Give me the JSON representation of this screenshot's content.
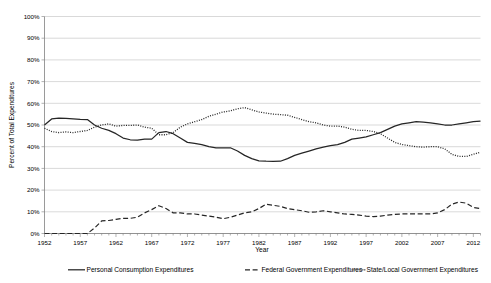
{
  "chart_data": {
    "type": "line",
    "title": "",
    "xlabel": "Year",
    "ylabel": "Percent of Total Expenditures",
    "ylim": [
      0,
      100
    ],
    "xlim": [
      1952,
      2013
    ],
    "ytick_labels": [
      "0%",
      "10%",
      "20%",
      "30%",
      "40%",
      "50%",
      "60%",
      "70%",
      "80%",
      "90%",
      "100%"
    ],
    "ytick_values": [
      0,
      10,
      20,
      30,
      40,
      50,
      60,
      70,
      80,
      90,
      100
    ],
    "xtick_labels": [
      "1952",
      "1957",
      "1962",
      "1967",
      "1972",
      "1977",
      "1982",
      "1987",
      "1992",
      "1997",
      "2002",
      "2007",
      "2012"
    ],
    "xtick_values": [
      1952,
      1957,
      1962,
      1967,
      1972,
      1977,
      1982,
      1987,
      1992,
      1997,
      2002,
      2007,
      2012
    ],
    "minor_tick_interval": 1,
    "grid": "horizontal",
    "legend_position": "bottom",
    "x": [
      1952,
      1953,
      1954,
      1955,
      1956,
      1957,
      1958,
      1959,
      1960,
      1961,
      1962,
      1963,
      1964,
      1965,
      1966,
      1967,
      1968,
      1969,
      1970,
      1971,
      1972,
      1973,
      1974,
      1975,
      1976,
      1977,
      1978,
      1979,
      1980,
      1981,
      1982,
      1983,
      1984,
      1985,
      1986,
      1987,
      1988,
      1989,
      1990,
      1991,
      1992,
      1993,
      1994,
      1995,
      1996,
      1997,
      1998,
      1999,
      2000,
      2001,
      2002,
      2003,
      2004,
      2005,
      2006,
      2007,
      2008,
      2009,
      2010,
      2011,
      2012,
      2013
    ],
    "series": [
      {
        "name": "Personal Consumption Expenditures",
        "style": "solid",
        "color": "#262626",
        "values": [
          50.0,
          52.8,
          53.2,
          53.0,
          52.8,
          52.6,
          52.5,
          50.0,
          48.5,
          47.5,
          46.0,
          44.0,
          43.2,
          43.0,
          43.5,
          43.5,
          46.5,
          47.0,
          46.0,
          44.0,
          42.0,
          41.5,
          41.0,
          40.0,
          39.5,
          39.5,
          39.5,
          38.0,
          36.0,
          34.5,
          33.5,
          33.3,
          33.2,
          33.3,
          34.5,
          36.0,
          37.0,
          38.0,
          39.0,
          39.8,
          40.5,
          41.0,
          42.0,
          43.5,
          44.0,
          44.5,
          45.5,
          46.5,
          48.0,
          49.5,
          50.5,
          51.0,
          51.5,
          51.3,
          51.0,
          50.5,
          50.0,
          50.0,
          50.5,
          51.0,
          51.5,
          51.8
        ],
        "unit": "%"
      },
      {
        "name": "Federal Government Expenditures",
        "style": "dashed",
        "color": "#262626",
        "values": [
          0.0,
          0.0,
          0.0,
          0.0,
          0.0,
          0.0,
          0.0,
          2.5,
          5.8,
          6.0,
          6.5,
          7.0,
          7.0,
          7.5,
          9.5,
          11.0,
          12.8,
          11.5,
          9.5,
          9.5,
          9.0,
          9.0,
          8.5,
          8.0,
          7.5,
          6.8,
          7.5,
          8.5,
          9.5,
          10.0,
          11.5,
          13.5,
          13.0,
          12.5,
          11.5,
          11.0,
          10.5,
          9.8,
          10.0,
          10.5,
          10.0,
          9.5,
          9.0,
          8.8,
          8.5,
          8.0,
          7.8,
          8.0,
          8.5,
          8.8,
          9.0,
          9.0,
          9.0,
          9.0,
          9.0,
          9.5,
          11.0,
          13.5,
          14.5,
          14.0,
          12.0,
          11.5
        ],
        "unit": "%"
      },
      {
        "name": "State/Local Government Expenditures",
        "style": "dotted",
        "color": "#595959",
        "values": [
          48.5,
          47.0,
          46.5,
          46.8,
          46.5,
          47.0,
          47.5,
          49.0,
          50.0,
          50.5,
          49.5,
          49.8,
          49.8,
          50.0,
          49.0,
          48.5,
          45.5,
          45.5,
          46.5,
          49.0,
          50.5,
          51.5,
          52.5,
          54.0,
          55.0,
          56.0,
          56.5,
          57.5,
          58.0,
          57.0,
          56.0,
          55.5,
          55.0,
          54.8,
          54.5,
          53.5,
          52.5,
          51.5,
          51.0,
          50.0,
          49.5,
          49.5,
          49.0,
          48.0,
          47.5,
          47.5,
          47.0,
          46.0,
          44.0,
          42.0,
          41.0,
          40.5,
          40.0,
          39.8,
          40.0,
          40.0,
          39.0,
          36.5,
          35.5,
          35.5,
          36.5,
          37.5
        ],
        "unit": "%"
      }
    ]
  },
  "legend": {
    "items": [
      {
        "label": "Personal Consumption Expenditures",
        "marker": "solid-line-marker"
      },
      {
        "label": "Federal Government Expenditures",
        "marker": "dashed-line-marker"
      },
      {
        "label": "State/Local Government Expenditures",
        "marker": "dotted-line-marker"
      }
    ]
  }
}
